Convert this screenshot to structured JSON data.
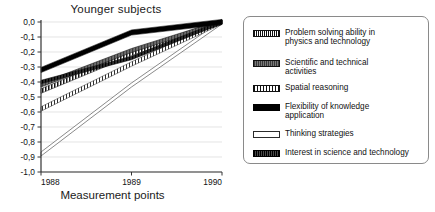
{
  "chart_data": {
    "type": "line",
    "title": "Younger subjects",
    "xlabel": "Measurement points",
    "ylabel": "",
    "x": [
      "1988",
      "1989",
      "1990"
    ],
    "categories": [
      "1988",
      "1989",
      "1990"
    ],
    "ylim": [
      -1.0,
      0.0
    ],
    "ytick_labels": [
      "0,0",
      "-0,1",
      "-0,2",
      "-0,3",
      "-0,4",
      "-0,5",
      "-0,6",
      "-0,7",
      "-0,8",
      "-0,9",
      "-1,0"
    ],
    "ytick_values": [
      0.0,
      -0.1,
      -0.2,
      -0.3,
      -0.4,
      -0.5,
      -0.6,
      -0.7,
      -0.8,
      -0.9,
      -1.0
    ],
    "grid": true,
    "legend_position": "right",
    "series": [
      {
        "name": "Problem solving ability in\nphysics and technology",
        "values": [
          -0.46,
          -0.21,
          0.0
        ],
        "swatch": "vhatch-dark",
        "color": "#111111"
      },
      {
        "name": "Scientific and technical\nactivities",
        "values": [
          -0.42,
          -0.19,
          0.0
        ],
        "swatch": "gray-solid",
        "color": "#5d5d5d"
      },
      {
        "name": "Spatial reasoning",
        "values": [
          -0.58,
          -0.28,
          0.0
        ],
        "swatch": "vhatch-light",
        "color": "#111111"
      },
      {
        "name": "Flexibility of knowledge\napplication",
        "values": [
          -0.32,
          -0.07,
          0.0
        ],
        "swatch": "black-thick",
        "color": "#000000"
      },
      {
        "name": "Thinking strategies",
        "values": [
          -0.88,
          -0.42,
          0.0
        ],
        "swatch": "hollow",
        "color": "#6b6b6b"
      },
      {
        "name": "Interest in science and technology",
        "values": [
          -0.4,
          -0.24,
          0.0
        ],
        "swatch": "darkband",
        "color": "#1f1f1f"
      }
    ]
  },
  "chart": {
    "title": "Younger subjects",
    "xaxis_title": "Measurement points",
    "xticks": [
      "1988",
      "1989",
      "1990"
    ],
    "yticks": [
      "0,0",
      "-0,1",
      "-0,2",
      "-0,3",
      "-0,4",
      "-0,5",
      "-0,6",
      "-0,7",
      "-0,8",
      "-0,9",
      "-1,0"
    ]
  },
  "legend": {
    "items": [
      {
        "label": "Problem solving ability in\nphysics and technology"
      },
      {
        "label": "Scientific and technical\nactivities"
      },
      {
        "label": "Spatial reasoning"
      },
      {
        "label": "Flexibility of knowledge\napplication"
      },
      {
        "label": "Thinking strategies"
      },
      {
        "label": "Interest in science and technology"
      }
    ]
  }
}
